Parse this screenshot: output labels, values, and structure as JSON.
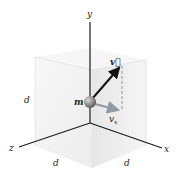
{
  "diagram": {
    "labels": {
      "y_axis": "y",
      "x_axis": "x",
      "z_axis": "z",
      "mass": "m",
      "velocity": "v⃗",
      "velocity_x": "v",
      "velocity_x_sub": "x",
      "edge_left": "d",
      "edge_bottom_left": "d",
      "edge_bottom_right": "d"
    },
    "colors": {
      "axis": "#1a1a1a",
      "cube_face_left": "#f3f3f3",
      "cube_face_right": "#ebebeb",
      "cube_face_top": "#f7f7f7",
      "cube_edge": "#d0d0d0",
      "sphere": "#8a8a8a",
      "velocity_arrow": "#111111",
      "vx_arrow": "#8f9aa3"
    }
  }
}
